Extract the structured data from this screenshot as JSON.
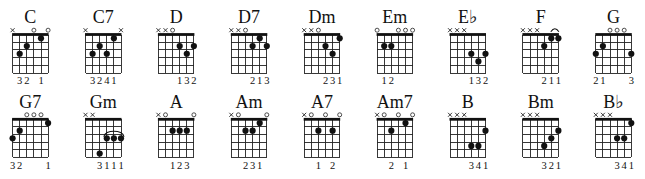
{
  "chart": {
    "strings_order": "low E (left) to high E (right)",
    "frets_shown": 5,
    "rows": [
      {
        "chords": [
          {
            "name": "C",
            "markers": [
              "x",
              "",
              "",
              "o",
              "",
              "o"
            ],
            "dots": [
              [
                1,
                3
              ],
              [
                2,
                2
              ],
              [
                4,
                1
              ]
            ],
            "fingers": [
              "",
              "3",
              "2",
              "",
              "1",
              ""
            ]
          },
          {
            "name": "C7",
            "markers": [
              "x",
              "",
              "",
              "",
              "",
              "x"
            ],
            "dots": [
              [
                1,
                3
              ],
              [
                2,
                2
              ],
              [
                3,
                3
              ],
              [
                4,
                1
              ]
            ],
            "fingers": [
              "",
              "3",
              "2",
              "4",
              "1",
              ""
            ]
          },
          {
            "name": "D",
            "markers": [
              "x",
              "x",
              "o",
              "",
              "",
              ""
            ],
            "dots": [
              [
                3,
                2
              ],
              [
                4,
                3
              ],
              [
                5,
                2
              ]
            ],
            "fingers": [
              "",
              "",
              "",
              "1",
              "3",
              "2"
            ]
          },
          {
            "name": "D7",
            "markers": [
              "x",
              "x",
              "o",
              "",
              "",
              ""
            ],
            "dots": [
              [
                3,
                2
              ],
              [
                4,
                1
              ],
              [
                5,
                2
              ]
            ],
            "fingers": [
              "",
              "",
              "",
              "2",
              "1",
              "3"
            ]
          },
          {
            "name": "Dm",
            "markers": [
              "x",
              "x",
              "o",
              "",
              "",
              ""
            ],
            "dots": [
              [
                3,
                2
              ],
              [
                4,
                3
              ],
              [
                5,
                1
              ]
            ],
            "fingers": [
              "",
              "",
              "",
              "2",
              "3",
              "1"
            ]
          },
          {
            "name": "Em",
            "markers": [
              "o",
              "",
              "",
              "o",
              "o",
              "o"
            ],
            "dots": [
              [
                1,
                2
              ],
              [
                2,
                2
              ]
            ],
            "fingers": [
              "",
              "1",
              "2",
              "",
              "",
              ""
            ]
          },
          {
            "name": "E♭",
            "markers": [
              "x",
              "x",
              "x",
              "",
              "",
              ""
            ],
            "dots": [
              [
                3,
                3
              ],
              [
                4,
                4
              ],
              [
                5,
                3
              ]
            ],
            "fingers": [
              "",
              "",
              "",
              "1",
              "3",
              "2"
            ]
          },
          {
            "name": "F",
            "markers": [
              "x",
              "x",
              "x",
              "",
              "",
              ""
            ],
            "dots": [
              [
                3,
                2
              ],
              [
                4,
                1
              ],
              [
                5,
                1
              ]
            ],
            "fingers": [
              "",
              "",
              "",
              "2",
              "1",
              "1"
            ],
            "marker_arc": [
              4,
              5
            ]
          },
          {
            "name": "G",
            "markers": [
              "",
              "",
              "o",
              "o",
              "o",
              ""
            ],
            "dots": [
              [
                0,
                3
              ],
              [
                1,
                2
              ],
              [
                5,
                3
              ]
            ],
            "fingers": [
              "2",
              "1",
              "",
              "",
              "",
              "3"
            ]
          }
        ]
      },
      {
        "chords": [
          {
            "name": "G7",
            "markers": [
              "",
              "",
              "o",
              "o",
              "o",
              ""
            ],
            "dots": [
              [
                0,
                3
              ],
              [
                1,
                2
              ],
              [
                5,
                1
              ]
            ],
            "fingers": [
              "3",
              "2",
              "",
              "",
              "",
              "1"
            ]
          },
          {
            "name": "Gm",
            "markers": [
              "x",
              "x",
              "",
              "",
              "",
              ""
            ],
            "dots": [
              [
                2,
                5
              ],
              [
                3,
                3
              ],
              [
                4,
                3
              ],
              [
                5,
                3
              ]
            ],
            "fingers": [
              "",
              "",
              "3",
              "1",
              "1",
              "1"
            ],
            "barre_arc": {
              "from": 3,
              "to": 5,
              "fret": 3
            }
          },
          {
            "name": "A",
            "markers": [
              "x",
              "o",
              "",
              "",
              "",
              "o"
            ],
            "dots": [
              [
                2,
                2
              ],
              [
                3,
                2
              ],
              [
                4,
                2
              ]
            ],
            "fingers": [
              "",
              "",
              "1",
              "2",
              "3",
              ""
            ]
          },
          {
            "name": "Am",
            "markers": [
              "x",
              "o",
              "",
              "",
              "",
              "o"
            ],
            "dots": [
              [
                2,
                2
              ],
              [
                3,
                2
              ],
              [
                4,
                1
              ]
            ],
            "fingers": [
              "",
              "",
              "2",
              "3",
              "1",
              ""
            ]
          },
          {
            "name": "A7",
            "markers": [
              "x",
              "o",
              "",
              "o",
              "",
              "o"
            ],
            "dots": [
              [
                2,
                2
              ],
              [
                4,
                2
              ]
            ],
            "fingers": [
              "",
              "",
              "1",
              "",
              "2",
              ""
            ]
          },
          {
            "name": "Am7",
            "markers": [
              "x",
              "o",
              "",
              "o",
              "",
              "o"
            ],
            "dots": [
              [
                2,
                2
              ],
              [
                4,
                1
              ]
            ],
            "fingers": [
              "",
              "",
              "2",
              "",
              "1",
              ""
            ]
          },
          {
            "name": "B",
            "markers": [
              "x",
              "x",
              "x",
              "",
              "",
              ""
            ],
            "dots": [
              [
                3,
                4
              ],
              [
                4,
                4
              ],
              [
                5,
                2
              ]
            ],
            "fingers": [
              "",
              "",
              "",
              "3",
              "4",
              "1"
            ]
          },
          {
            "name": "Bm",
            "markers": [
              "x",
              "x",
              "x",
              "",
              "",
              ""
            ],
            "dots": [
              [
                3,
                4
              ],
              [
                4,
                3
              ],
              [
                5,
                2
              ]
            ],
            "fingers": [
              "",
              "",
              "",
              "3",
              "2",
              "1"
            ]
          },
          {
            "name": "B♭",
            "markers": [
              "x",
              "x",
              "x",
              "",
              "",
              ""
            ],
            "dots": [
              [
                3,
                3
              ],
              [
                4,
                3
              ],
              [
                5,
                1
              ]
            ],
            "fingers": [
              "",
              "",
              "",
              "3",
              "4",
              "1"
            ]
          }
        ]
      }
    ]
  }
}
